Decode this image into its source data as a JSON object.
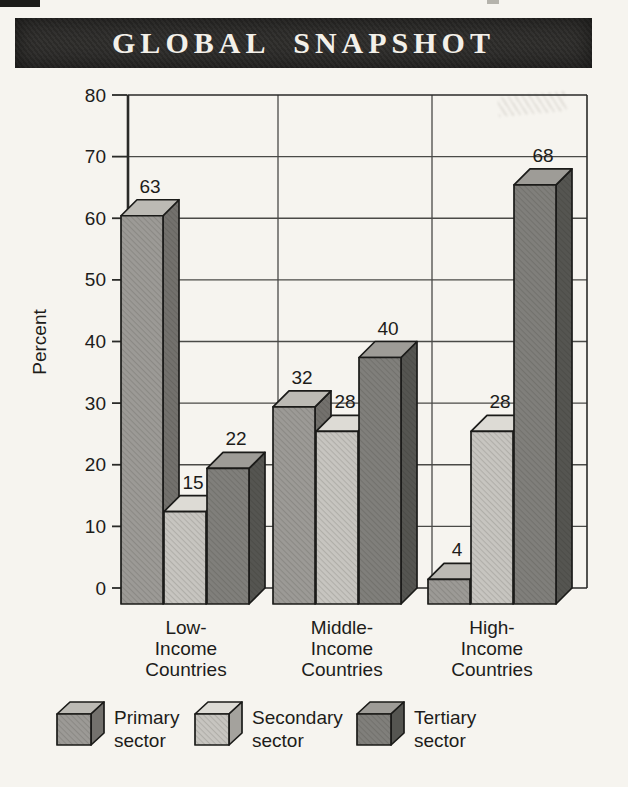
{
  "banner": {
    "background": "#2e2d2b",
    "text_color": "#f3f0e9"
  },
  "chart_data": {
    "type": "bar",
    "style": "3d-column-grouped",
    "title": "GLOBAL SNAPSHOT",
    "xlabel": "",
    "ylabel": "Percent",
    "ylim": [
      0,
      80
    ],
    "ytick_step": 10,
    "yticks": [
      0,
      10,
      20,
      30,
      40,
      50,
      60,
      70,
      80
    ],
    "grid": true,
    "legend_position": "bottom",
    "categories": [
      "Low-Income Countries",
      "Middle-Income Countries",
      "High-Income Countries"
    ],
    "category_lines": [
      [
        "Low-",
        "Income",
        "Countries"
      ],
      [
        "Middle-",
        "Income",
        "Countries"
      ],
      [
        "High-",
        "Income",
        "Countries"
      ]
    ],
    "series": [
      {
        "name": "Primary sector",
        "values": [
          63,
          32,
          4
        ],
        "front": "#9c9a96",
        "top": "#bcbab4",
        "side": "#73716d"
      },
      {
        "name": "Secondary sector",
        "values": [
          15,
          28,
          28
        ],
        "front": "#c7c5c0",
        "top": "#dddbd5",
        "side": "#a4a29d"
      },
      {
        "name": "Tertiary sector",
        "values": [
          22,
          40,
          68
        ],
        "front": "#807f7b",
        "top": "#9e9c97",
        "side": "#555551"
      }
    ],
    "frame_color": "#2a2a28",
    "grid_color": "#4a4a47",
    "label_color": "#1d1c1a"
  },
  "legend": {
    "items": [
      {
        "lines": [
          "Primary",
          "sector"
        ]
      },
      {
        "lines": [
          "Secondary",
          "sector"
        ]
      },
      {
        "lines": [
          "Tertiary",
          "sector"
        ]
      }
    ]
  }
}
